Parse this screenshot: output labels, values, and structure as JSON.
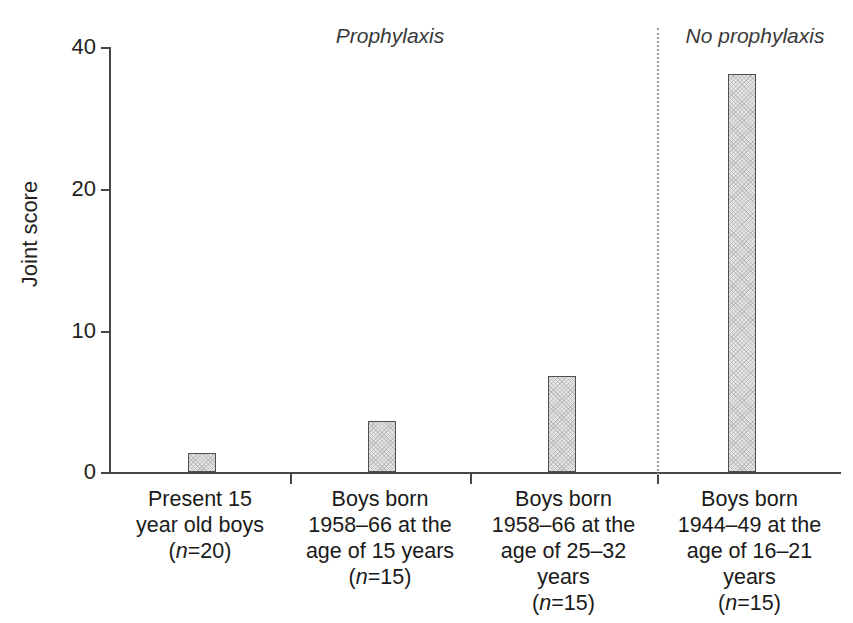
{
  "chart_data": {
    "type": "bar",
    "title": "",
    "xlabel": "",
    "ylabel": "Joint score",
    "ylim": [
      0,
      40
    ],
    "yticks": [
      0,
      10,
      20,
      40
    ],
    "ytick_labels": [
      "0",
      "10",
      "20",
      "40"
    ],
    "grid": false,
    "legend_position": "none",
    "bar_fill_color": "#e4e4e4",
    "bar_edge_color": "#4d4f51",
    "divider_color": "#9a9a9a",
    "categories": [
      "Present 15 year old boys (n=20)",
      "Boys born 1958–66 at the age of 15 years (n=15)",
      "Boys born 1958–66 at the age of 25–32 years (n=15)",
      "Boys born 1944–49 at the age of 16–21 years (n=15)"
    ],
    "values": [
      1.8,
      4.8,
      9.0,
      37.4
    ],
    "annotations": [
      {
        "text": "Prophylaxis",
        "covers_categories": [
          0,
          1,
          2
        ],
        "style": "italic"
      },
      {
        "text": "No prophylaxis",
        "covers_categories": [
          3
        ],
        "style": "italic"
      }
    ]
  },
  "axis": {
    "y_title": "Joint score",
    "y_ticks": [
      {
        "label": "40",
        "value": 40
      },
      {
        "label": "20",
        "value": 20
      },
      {
        "label": "10",
        "value": 10
      },
      {
        "label": "0",
        "value": 0
      }
    ]
  },
  "groups": [
    {
      "label": "Prophylaxis"
    },
    {
      "label": "No prophylaxis"
    }
  ],
  "bars": [
    {
      "value": 1.8,
      "label_lines": [
        {
          "text": "Present 15"
        },
        {
          "text": "year old boys"
        },
        {
          "prefix": "(",
          "italic": "n",
          "suffix": "=20)"
        }
      ]
    },
    {
      "value": 4.8,
      "label_lines": [
        {
          "text": "Boys born"
        },
        {
          "text": "1958–66 at the"
        },
        {
          "text": "age of 15 years"
        },
        {
          "prefix": "(",
          "italic": "n",
          "suffix": "=15)"
        }
      ]
    },
    {
      "value": 9.0,
      "label_lines": [
        {
          "text": "Boys born"
        },
        {
          "text": "1958–66 at the"
        },
        {
          "text": "age of 25–32"
        },
        {
          "text": "years"
        },
        {
          "prefix": "(",
          "italic": "n",
          "suffix": "=15)"
        }
      ]
    },
    {
      "value": 37.4,
      "label_lines": [
        {
          "text": "Boys born"
        },
        {
          "text": "1944–49 at the"
        },
        {
          "text": "age of 16–21"
        },
        {
          "text": "years"
        },
        {
          "prefix": "(",
          "italic": "n",
          "suffix": "=15)"
        }
      ]
    }
  ]
}
